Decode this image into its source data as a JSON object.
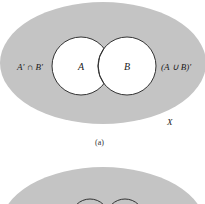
{
  "figure_a": {
    "universe_label": "X",
    "set_a_label": "A",
    "set_b_label": "B",
    "outside_left_label": "A′ ∩ B′",
    "outside_right_label": "(A ∪ B)′",
    "caption": "(a)"
  },
  "figure_b": {
    "caption": ""
  },
  "colors": {
    "shading": "#c4c4c4",
    "circle_fill": "#ffffff",
    "stroke": "#333333"
  }
}
